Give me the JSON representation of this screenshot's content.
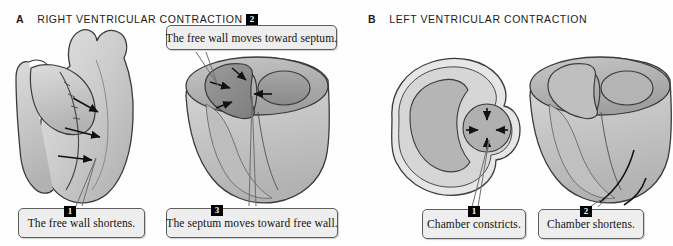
{
  "figure": {
    "background_color": "#fefefe",
    "style": "grayscale anatomical line drawing",
    "panels": [
      {
        "letter": "A",
        "title": "RIGHT VENTRICULAR CONTRACTION",
        "illustrations": [
          {
            "name": "anterior-heart-view",
            "description": "anterior external view of the heart with three arrows on the right ventricular free wall pointing toward the septum"
          },
          {
            "name": "ventricle-cutaway-view",
            "description": "three-dimensional cut-away of the ventricles showing crescent-shaped right ventricular cavity and circular left ventricular cavity with arrows converging on the septum"
          }
        ],
        "callouts": [
          {
            "number": "1",
            "text": "The free wall shortens."
          },
          {
            "number": "2",
            "text": "The free wall moves toward septum."
          },
          {
            "number": "3",
            "text": "The septum moves toward free wall."
          }
        ]
      },
      {
        "letter": "B",
        "title": "LEFT VENTRICULAR CONTRACTION",
        "illustrations": [
          {
            "name": "transverse-cross-section",
            "description": "transverse cross-section through the ventricles with four arrows converging inward on the circular left ventricular chamber"
          },
          {
            "name": "ventricle-cutaway-view",
            "description": "three-dimensional cut-away of the ventricles with a curved arrow at the apex indicating longitudinal shortening"
          }
        ],
        "callouts": [
          {
            "number": "1",
            "text": "Chamber constricts."
          },
          {
            "number": "2",
            "text": "Chamber shortens."
          }
        ]
      }
    ],
    "colors": {
      "callout_fill": "#eeeeee",
      "callout_border": "#5d5d5d",
      "badge_fill": "#000000",
      "badge_text": "#ffffff",
      "myocardium_light": "#d4d4d4",
      "myocardium_mid": "#b9b9b9",
      "cavity_dark": "#8f8f8f",
      "outline": "#3a3a3a"
    }
  }
}
